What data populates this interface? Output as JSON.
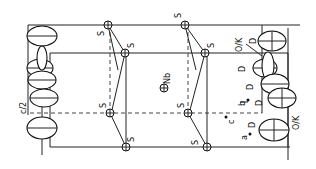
{
  "figure": {
    "labels": {
      "sulfur": "S",
      "niobium": "Nb",
      "deuterium": "D",
      "oxygen_potassium": "O/K",
      "half_c": "c/2",
      "axis_a": "a",
      "axis_b": "b",
      "axis_c": "c"
    },
    "atoms": {
      "S_count": 8,
      "Nb_count": 1,
      "D_label_count": 5,
      "OK_label_count": 2
    }
  }
}
